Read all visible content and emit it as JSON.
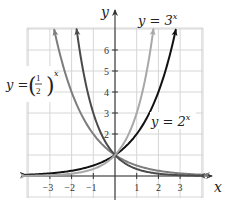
{
  "chart_data": {
    "type": "line",
    "title": "",
    "xlabel": "x",
    "ylabel": "y",
    "xlim": [
      -4.1,
      4.1
    ],
    "ylim": [
      -1.0,
      7.0
    ],
    "grid": true,
    "x_ticks": [
      -3,
      -2,
      -1,
      1,
      2,
      3
    ],
    "x_tick_labels": [
      "−3",
      "−2",
      "−1",
      "1",
      "2",
      "3"
    ],
    "y_ticks": [
      2,
      3,
      4,
      5,
      6
    ],
    "y_tick_labels": [
      "2",
      "3",
      "4",
      "5",
      "6"
    ],
    "series": [
      {
        "name": "y = 2^x",
        "label_visible": true,
        "base": 2,
        "color": "#111111",
        "x_range": [
          -4.1,
          2.8
        ]
      },
      {
        "name": "y = 3^x",
        "label_visible": true,
        "base": 3,
        "color": "#a8a8a8",
        "x_range": [
          -4.1,
          1.77
        ]
      },
      {
        "name": "y = (1/2)^x",
        "label_visible": true,
        "base": 0.5,
        "color": "#7d7d7d",
        "x_range": [
          -2.8,
          4.1
        ]
      },
      {
        "name": "unlabeled (likely y = (1/3)^x)",
        "label_visible": false,
        "base": 0.3333,
        "color": "#4a4a4a",
        "x_range": [
          -1.77,
          3.9
        ]
      }
    ],
    "intersection": {
      "x": 0,
      "y": 1
    },
    "annotations": [
      {
        "text": "y = 3",
        "sup": "x",
        "series": 1
      },
      {
        "text": "y = 2",
        "sup": "x",
        "series": 0
      },
      {
        "text": "y = (1/2)",
        "sup": "x",
        "series": 2
      }
    ]
  },
  "labels": {
    "axis_x": "x",
    "axis_y": "y",
    "eq_3x_base": "y = 3",
    "eq_3x_exp": "x",
    "eq_2x_base": "y = 2",
    "eq_2x_exp": "x",
    "eq_half_prefix": "y =",
    "eq_half_num": "1",
    "eq_half_den": "2",
    "eq_half_exp": "x"
  }
}
